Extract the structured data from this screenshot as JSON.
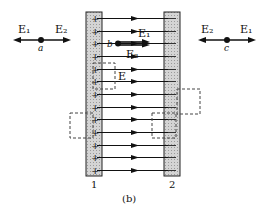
{
  "figure": {
    "caption": "(b)",
    "plate_labels": [
      "1",
      "2"
    ],
    "plate1_sign": "+",
    "plate2_sign": "—",
    "field_line_count": 13,
    "colors": {
      "plate_fill": "#d2d2d2",
      "line": "#111111",
      "dashed_box": "#444444"
    }
  },
  "points": {
    "a": {
      "label": "a",
      "left_vector": "E₁",
      "right_vector": "E₂"
    },
    "b": {
      "label": "b",
      "upper_vector": "E₁",
      "lower_vector": "E₂"
    },
    "c": {
      "label": "c",
      "left_vector": "E₂",
      "right_vector": "E₁"
    }
  },
  "gauss_boxes": [
    {
      "name": "box-in-gap-near-plate1",
      "label": "E"
    },
    {
      "name": "box-left-of-plate1",
      "label": ""
    },
    {
      "name": "box-right-of-plate2",
      "label": ""
    },
    {
      "name": "box-across-plate2",
      "label": ""
    }
  ]
}
